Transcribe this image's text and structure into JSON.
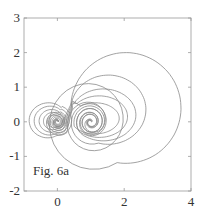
{
  "chart_data": {
    "type": "line",
    "title": "",
    "annotation": "Fig. 6a",
    "xlabel": "",
    "ylabel": "",
    "xlim": [
      -1,
      4
    ],
    "ylim": [
      -2,
      3
    ],
    "xticks": [
      0,
      2,
      4
    ],
    "yticks": [
      -2,
      -1,
      0,
      1,
      2,
      3
    ],
    "xtick_labels": [
      "0",
      "2",
      "4"
    ],
    "ytick_labels": [
      "-2",
      "-1",
      "0",
      "1",
      "2",
      "3"
    ],
    "grid": false,
    "legend": null,
    "line_color": "#8a8a8a",
    "spiral_centers": [
      [
        0,
        0
      ],
      [
        1,
        0
      ]
    ],
    "series": [
      {
        "name": "curve-1",
        "left_loop_min_x": -0.85,
        "right_loop_max_x": 3.7,
        "right_loop_top_y": 2.0,
        "right_loop_bottom_y": -1.2
      },
      {
        "name": "curve-2",
        "left_loop_min_x": -0.7,
        "right_loop_max_x": 2.65,
        "right_loop_top_y": 1.35,
        "right_loop_bottom_y": -0.65
      },
      {
        "name": "curve-3",
        "left_loop_min_x": -0.55,
        "right_loop_max_x": 2.35,
        "right_loop_top_y": 0.95,
        "right_loop_bottom_y": -0.55
      },
      {
        "name": "curve-4",
        "left_loop_min_x": -0.42,
        "right_loop_max_x": 2.1,
        "right_loop_top_y": 0.75,
        "right_loop_bottom_y": -0.45
      },
      {
        "name": "curve-5",
        "left_loop_min_x": -0.3,
        "right_loop_max_x": 1.85,
        "right_loop_top_y": 0.55,
        "right_loop_bottom_y": -0.35
      }
    ]
  }
}
